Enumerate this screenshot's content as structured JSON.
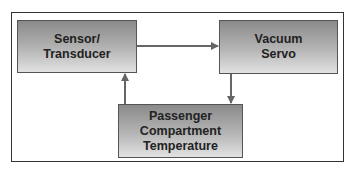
{
  "diagram": {
    "nodes": [
      {
        "id": "sensor",
        "label": "Sensor/\nTransducer"
      },
      {
        "id": "servo",
        "label": "Vacuum\nServo"
      },
      {
        "id": "temp",
        "label": "Passenger\nCompartment\nTemperature"
      }
    ],
    "edges": [
      {
        "from": "sensor",
        "to": "servo"
      },
      {
        "from": "servo",
        "to": "temp"
      },
      {
        "from": "temp",
        "to": "sensor"
      }
    ],
    "colors": {
      "arrow": "#666666",
      "frame": "#333333"
    }
  }
}
